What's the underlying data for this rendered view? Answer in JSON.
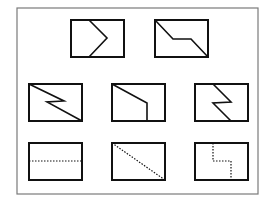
{
  "colors": {
    "background": "#ffffff",
    "frame": "#7a7a7a",
    "stroke": "#111111"
  },
  "frame": {
    "x": 17,
    "y": 8,
    "w": 241,
    "h": 186
  },
  "question_figures": [
    {
      "id": "A",
      "box": {
        "x": 71,
        "y": 20,
        "w": 53,
        "h": 37
      },
      "line": {
        "style": "solid",
        "points": "89,20 107,38 89,57"
      }
    },
    {
      "id": "B",
      "box": {
        "x": 155,
        "y": 20,
        "w": 53,
        "h": 37
      },
      "line": {
        "style": "solid",
        "points": "155,20 173,39 191,39 208,57"
      }
    }
  ],
  "middle_figures": [
    {
      "id": "C",
      "box": {
        "x": 29,
        "y": 84,
        "w": 53,
        "h": 37
      },
      "line": {
        "style": "solid",
        "points": "29,84 64,101 47,102 82,121"
      }
    },
    {
      "id": "D",
      "box": {
        "x": 112,
        "y": 84,
        "w": 53,
        "h": 37
      },
      "line": {
        "style": "solid",
        "points": "112,84 147,103 147,121"
      }
    },
    {
      "id": "E",
      "box": {
        "x": 195,
        "y": 84,
        "w": 53,
        "h": 37
      },
      "line": {
        "style": "solid",
        "points": "213,84 231,102 213,103 231,121"
      }
    }
  ],
  "answer_figures": [
    {
      "id": "F",
      "box": {
        "x": 29,
        "y": 143,
        "w": 53,
        "h": 37
      },
      "line": {
        "style": "dotted",
        "points": "29,161 82,161"
      }
    },
    {
      "id": "G",
      "box": {
        "x": 112,
        "y": 143,
        "w": 53,
        "h": 37
      },
      "line": {
        "style": "dotted",
        "points": "112,143 165,180"
      }
    },
    {
      "id": "H",
      "box": {
        "x": 195,
        "y": 143,
        "w": 53,
        "h": 37
      },
      "line": {
        "style": "dotted",
        "points": "213,143 213,161 231,161 231,180"
      }
    }
  ]
}
